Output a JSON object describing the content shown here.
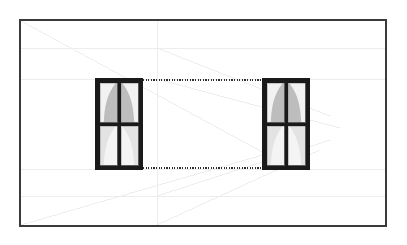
{
  "document": {
    "title": "Window Elevation Drawing",
    "type": "architectural-elevation",
    "canvas": {
      "width": 407,
      "height": 245,
      "background": "#ffffff"
    }
  },
  "frame": {
    "name": "drawing-border",
    "x": 20,
    "y": 20,
    "width": 366,
    "height": 206,
    "stroke": "#3a3a3a",
    "stroke_width": 1.6
  },
  "windows": [
    {
      "id": "window-left",
      "label": "Left Window",
      "x": 95,
      "y": 78,
      "width": 48,
      "height": 92,
      "frame_color": "#1a1a1a",
      "frame_thickness": 5,
      "mullion_thickness": 4,
      "columns": 2,
      "rows": 2,
      "upper_pane_fill": "#bdbdbd",
      "upper_curtain_fill": "#f2f2f2",
      "lower_pane_fill": "#f4f4f4",
      "lower_curtain_fill": "#e3e3e3"
    },
    {
      "id": "window-right",
      "label": "Right Window",
      "x": 262,
      "y": 78,
      "width": 48,
      "height": 92,
      "frame_color": "#1a1a1a",
      "frame_thickness": 5,
      "mullion_thickness": 4,
      "columns": 2,
      "rows": 2,
      "upper_pane_fill": "#bdbdbd",
      "upper_curtain_fill": "#f2f2f2",
      "lower_pane_fill": "#f4f4f4",
      "lower_curtain_fill": "#e3e3e3"
    }
  ],
  "dimension_lines": [
    {
      "id": "dotted-line-top",
      "label": "Top alignment line",
      "x1": 143,
      "y1": 80,
      "x2": 262,
      "y2": 80,
      "style": "dotted",
      "color": "#2e2e2e",
      "width": 1.4
    },
    {
      "id": "dotted-line-bottom",
      "label": "Bottom alignment line",
      "x1": 143,
      "y1": 168,
      "x2": 262,
      "y2": 168,
      "style": "dotted",
      "color": "#2e2e2e",
      "width": 1.4
    }
  ],
  "guides": {
    "color": "#ebebeb",
    "width": 0.9,
    "vanishing_point": {
      "x": 266,
      "y": 154
    },
    "horizontals": [
      {
        "id": "guide-h-upper",
        "y": 48,
        "x1": 21,
        "x2": 385
      },
      {
        "id": "guide-h-window-top",
        "y": 79,
        "x1": 21,
        "x2": 385
      },
      {
        "id": "guide-h-window-bottom",
        "y": 169,
        "x1": 21,
        "x2": 385
      },
      {
        "id": "guide-h-lower",
        "y": 196,
        "x1": 21,
        "x2": 385
      }
    ],
    "verticals": [
      {
        "id": "guide-v-center",
        "x": 157,
        "y1": 21,
        "y2": 225
      }
    ],
    "diagonals": [
      {
        "id": "guide-d-1",
        "x1": 157,
        "y1": 48,
        "x2": 330,
        "y2": 116
      },
      {
        "id": "guide-d-2",
        "x1": 157,
        "y1": 79,
        "x2": 340,
        "y2": 128
      },
      {
        "id": "guide-d-3",
        "x1": 157,
        "y1": 196,
        "x2": 330,
        "y2": 140
      },
      {
        "id": "guide-d-4",
        "x1": 157,
        "y1": 225,
        "x2": 320,
        "y2": 150
      },
      {
        "id": "guide-d-5",
        "x1": 21,
        "y1": 225,
        "x2": 266,
        "y2": 154
      },
      {
        "id": "guide-d-6",
        "x1": 21,
        "y1": 21,
        "x2": 266,
        "y2": 154
      }
    ]
  }
}
